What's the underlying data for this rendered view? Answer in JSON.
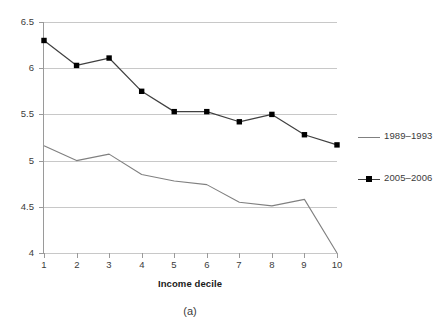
{
  "chart_data": {
    "type": "line",
    "title": "",
    "xlabel": "Income decile",
    "ylabel": "",
    "caption": "(a)",
    "categories": [
      "1",
      "2",
      "3",
      "4",
      "5",
      "6",
      "7",
      "8",
      "9",
      "10"
    ],
    "x": [
      1,
      2,
      3,
      4,
      5,
      6,
      7,
      8,
      9,
      10
    ],
    "xlim": [
      1,
      10
    ],
    "ylim": [
      4,
      6.5
    ],
    "yticks": [
      "4",
      "4.5",
      "5",
      "5.5",
      "6",
      "6.5"
    ],
    "ytick_values": [
      4,
      4.5,
      5,
      5.5,
      6,
      6.5
    ],
    "grid": true,
    "legend_position": "right",
    "series": [
      {
        "name": "1989–1993",
        "color": "#808080",
        "marker": "none",
        "values": [
          5.16,
          5.0,
          5.07,
          4.85,
          4.78,
          4.74,
          4.55,
          4.51,
          4.58,
          4.0
        ]
      },
      {
        "name": "2005–2006",
        "color": "#404040",
        "marker": "square",
        "marker_color": "#000000",
        "values": [
          6.3,
          6.03,
          6.11,
          5.75,
          5.53,
          5.53,
          5.42,
          5.5,
          5.28,
          5.17
        ]
      }
    ]
  },
  "legend": {
    "items": [
      {
        "label": "1989–1993"
      },
      {
        "label": "2005–2006"
      }
    ]
  },
  "axes": {
    "x_title": "Income decile",
    "x_ticks": [
      "1",
      "2",
      "3",
      "4",
      "5",
      "6",
      "7",
      "8",
      "9",
      "10"
    ],
    "y_ticks": [
      "6.5",
      "6",
      "5.5",
      "5",
      "4.5",
      "4"
    ]
  },
  "caption": {
    "text": "(a)"
  },
  "colors": {
    "series_1989": "#808080",
    "series_2005": "#404040",
    "gridline": "#c8c8c8",
    "axis": "#9a9a9a",
    "text": "#3b3b3b",
    "background": "#ffffff"
  }
}
